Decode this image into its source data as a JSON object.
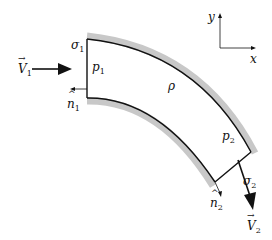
{
  "diagram": {
    "labels": {
      "V1": {
        "sym": "V",
        "sub": "1"
      },
      "V2": {
        "sym": "V",
        "sub": "2"
      },
      "n1": {
        "sym": "n",
        "sub": "1"
      },
      "n2": {
        "sym": "n",
        "sub": "2"
      },
      "p1": {
        "sym": "p",
        "sub": "1"
      },
      "p2": {
        "sym": "p",
        "sub": "2"
      },
      "sigma1": {
        "sym": "σ",
        "sub": "1"
      },
      "sigma2": {
        "sym": "σ",
        "sub": "2"
      },
      "rho": "ρ",
      "x": "x",
      "y": "y"
    },
    "colors": {
      "wall": "#c8c8c8",
      "line": "#111111"
    }
  }
}
